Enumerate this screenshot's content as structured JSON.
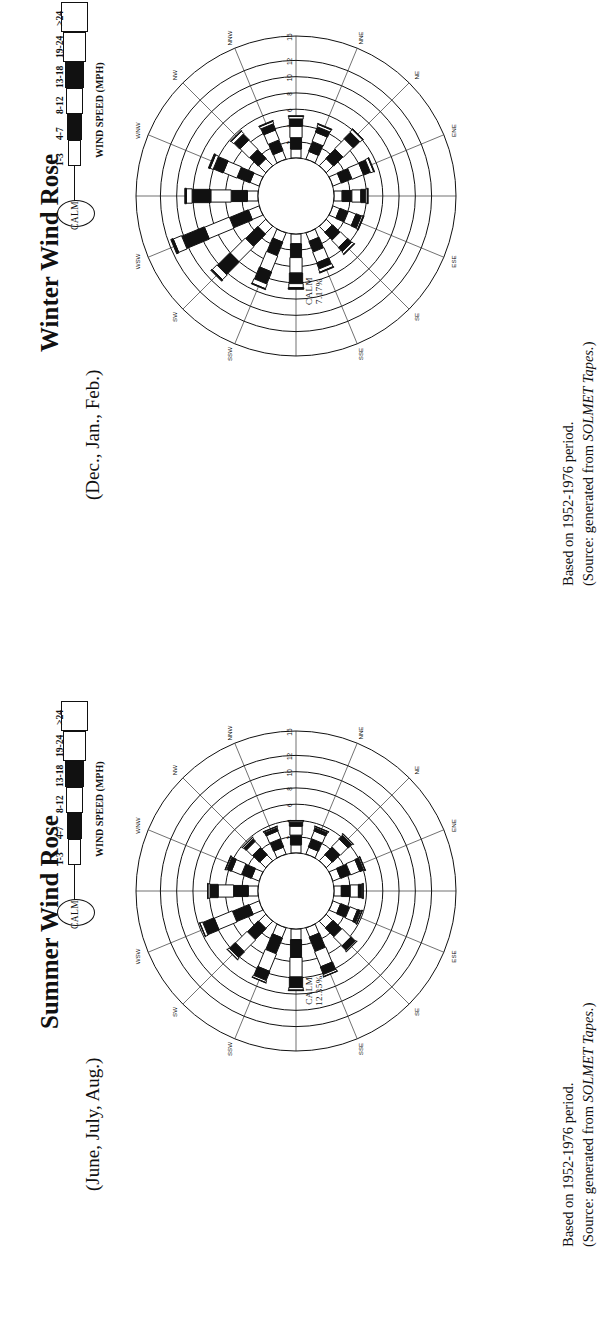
{
  "page": {
    "background": "#ffffff",
    "ink": "#111111"
  },
  "panels": [
    {
      "id": "winter",
      "title": "Winter Wind Rose",
      "subtitle": "(Dec., Jan., Feb.)",
      "calm_label": "CALM",
      "calm_value": "7.17%",
      "footer": {
        "line1": "Based on 1952-1976 period.",
        "line2_prefix": "(Source:  generated from ",
        "line2_em": "SOLMET Tapes.",
        "line2_suffix": ")"
      },
      "chart_data": {
        "type": "wind-rose",
        "title": "Winter Wind Rose",
        "subtitle": "(Dec., Jan., Feb.)",
        "calm_percent": 7.17,
        "ring_labels": [
          "2",
          "4",
          "6",
          "8",
          "10",
          "12",
          "15"
        ],
        "ring_values": [
          2,
          4,
          6,
          8,
          10,
          12,
          15
        ],
        "ring_unit": "percent frequency",
        "speed_bins": [
          "1-3",
          "4-7",
          "8-12",
          "13-18",
          "19-24",
          ">24"
        ],
        "bin_fills": [
          "white",
          "black",
          "white",
          "black",
          "white",
          "black"
        ],
        "directions": [
          "N",
          "NNE",
          "NE",
          "ENE",
          "E",
          "ESE",
          "SE",
          "SSE",
          "S",
          "SSW",
          "SW",
          "WSW",
          "W",
          "WNW",
          "NW",
          "NNW"
        ],
        "total_by_direction": [
          5.2,
          4.6,
          6.1,
          5.4,
          4.2,
          4.0,
          4.6,
          5.2,
          6.8,
          7.4,
          9.2,
          11.6,
          9.0,
          6.6,
          5.8,
          5.0
        ],
        "series": [
          {
            "name": "1-3",
            "values": [
              1.1,
              1.0,
              1.2,
              1.1,
              1.0,
              0.9,
              1.0,
              1.1,
              1.2,
              1.2,
              1.3,
              1.4,
              1.3,
              1.2,
              1.2,
              1.1
            ]
          },
          {
            "name": "4-7",
            "values": [
              1.4,
              1.3,
              1.6,
              1.4,
              1.2,
              1.1,
              1.3,
              1.4,
              1.7,
              1.8,
              2.1,
              2.5,
              2.0,
              1.7,
              1.5,
              1.4
            ]
          },
          {
            "name": "8-12",
            "values": [
              1.4,
              1.2,
              1.7,
              1.5,
              1.1,
              1.0,
              1.2,
              1.4,
              1.9,
              2.1,
              2.6,
              3.3,
              2.5,
              1.8,
              1.6,
              1.3
            ]
          },
          {
            "name": "13-18",
            "values": [
              0.9,
              0.7,
              1.1,
              0.9,
              0.6,
              0.7,
              0.7,
              0.8,
              1.3,
              1.6,
              2.2,
              3.0,
              2.3,
              1.3,
              1.0,
              0.8
            ]
          },
          {
            "name": "19-24",
            "values": [
              0.3,
              0.3,
              0.4,
              0.4,
              0.2,
              0.2,
              0.3,
              0.4,
              0.5,
              0.6,
              0.8,
              1.1,
              0.7,
              0.4,
              0.4,
              0.3
            ]
          },
          {
            "name": ">24",
            "values": [
              0.1,
              0.1,
              0.1,
              0.1,
              0.1,
              0.1,
              0.1,
              0.1,
              0.2,
              0.1,
              0.2,
              0.3,
              0.2,
              0.2,
              0.1,
              0.1
            ]
          }
        ]
      }
    },
    {
      "id": "summer",
      "title": "Summer Wind Rose",
      "subtitle": "(June, July, Aug.)",
      "calm_label": "CALM",
      "calm_value": "12.35%",
      "footer": {
        "line1": "Based on 1952-1976 period.",
        "line2_prefix": "(Source:  generated from ",
        "line2_em": "SOLMET Tapes.",
        "line2_suffix": ")"
      },
      "chart_data": {
        "type": "wind-rose",
        "title": "Summer Wind Rose",
        "subtitle": "(June, July, Aug.)",
        "calm_percent": 12.35,
        "ring_labels": [
          "2",
          "4",
          "6",
          "8",
          "10",
          "12",
          "15"
        ],
        "ring_values": [
          2,
          4,
          6,
          8,
          10,
          12,
          15
        ],
        "ring_unit": "percent frequency",
        "speed_bins": [
          "1-3",
          "4-7",
          "8-12",
          "13-18",
          "19-24",
          ">24"
        ],
        "bin_fills": [
          "white",
          "black",
          "white",
          "black",
          "white",
          "black"
        ],
        "directions": [
          "N",
          "NNE",
          "NE",
          "ENE",
          "E",
          "ESE",
          "SE",
          "SSE",
          "S",
          "SSW",
          "SW",
          "WSW",
          "W",
          "WNW",
          "NW",
          "NNW"
        ],
        "total_by_direction": [
          4.0,
          3.6,
          4.4,
          4.2,
          3.6,
          3.8,
          5.0,
          6.4,
          7.6,
          7.2,
          6.4,
          7.8,
          6.2,
          4.4,
          3.8,
          3.6
        ],
        "series": [
          {
            "name": "1-3",
            "values": [
              1.0,
              0.9,
              1.0,
              1.0,
              0.9,
              1.0,
              1.1,
              1.2,
              1.3,
              1.3,
              1.2,
              1.3,
              1.2,
              1.0,
              1.0,
              0.9
            ]
          },
          {
            "name": "4-7",
            "values": [
              1.2,
              1.1,
              1.3,
              1.3,
              1.1,
              1.2,
              1.5,
              1.9,
              2.2,
              2.1,
              1.9,
              2.2,
              1.8,
              1.3,
              1.2,
              1.1
            ]
          },
          {
            "name": "8-12",
            "values": [
              1.1,
              1.0,
              1.3,
              1.2,
              1.0,
              1.0,
              1.5,
              2.0,
              2.4,
              2.3,
              2.0,
              2.4,
              1.9,
              1.3,
              1.0,
              1.0
            ]
          },
          {
            "name": "13-18",
            "values": [
              0.5,
              0.4,
              0.6,
              0.5,
              0.4,
              0.4,
              0.7,
              1.0,
              1.3,
              1.2,
              1.0,
              1.5,
              1.0,
              0.6,
              0.4,
              0.4
            ]
          },
          {
            "name": "19-24",
            "values": [
              0.15,
              0.15,
              0.15,
              0.15,
              0.15,
              0.15,
              0.15,
              0.25,
              0.3,
              0.25,
              0.25,
              0.35,
              0.25,
              0.15,
              0.15,
              0.15
            ]
          },
          {
            "name": ">24",
            "values": [
              0.05,
              0.05,
              0.05,
              0.05,
              0.05,
              0.05,
              0.05,
              0.05,
              0.08,
              0.05,
              0.05,
              0.05,
              0.05,
              0.05,
              0.05,
              0.05
            ]
          }
        ]
      }
    }
  ],
  "legend": {
    "calm_label": "CALM",
    "axis_label": "WIND SPEED (MPH)",
    "bins": [
      "1-3",
      "4-7",
      "8-12",
      "13-18",
      "19-24",
      ">24"
    ]
  }
}
